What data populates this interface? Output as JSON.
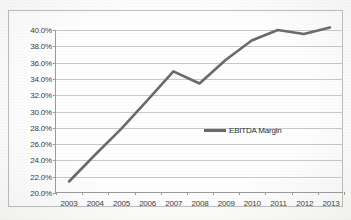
{
  "chart_data": {
    "type": "line",
    "title": "",
    "subtitle": "",
    "xlabel": "",
    "ylabel": "",
    "categories": [
      "2003",
      "2004",
      "2005",
      "2006",
      "2007",
      "2008",
      "2009",
      "2010",
      "2011",
      "2012",
      "2013"
    ],
    "series": [
      {
        "name": "EBITDA Margin",
        "color": "#6a6a6a",
        "values": [
          21.3,
          24.6,
          27.8,
          31.3,
          34.9,
          33.4,
          36.3,
          38.7,
          40.0,
          39.5,
          40.3
        ]
      }
    ],
    "ylim": [
      20.0,
      40.0
    ],
    "ytick_values": [
      20.0,
      22.0,
      24.0,
      26.0,
      28.0,
      30.0,
      32.0,
      34.0,
      36.0,
      38.0,
      40.0
    ],
    "ytick_labels": [
      "20.0%",
      "22.0%",
      "24.0%",
      "26.0%",
      "28.0%",
      "30.0%",
      "32.0%",
      "34.0%",
      "36.0%",
      "38.0%",
      "40.0%"
    ],
    "grid": true,
    "legend_position": "inside-center-right",
    "legend_entries": [
      "EBITDA Margin"
    ],
    "annotations": []
  },
  "legend": {
    "label": "EBITDA Margin"
  }
}
